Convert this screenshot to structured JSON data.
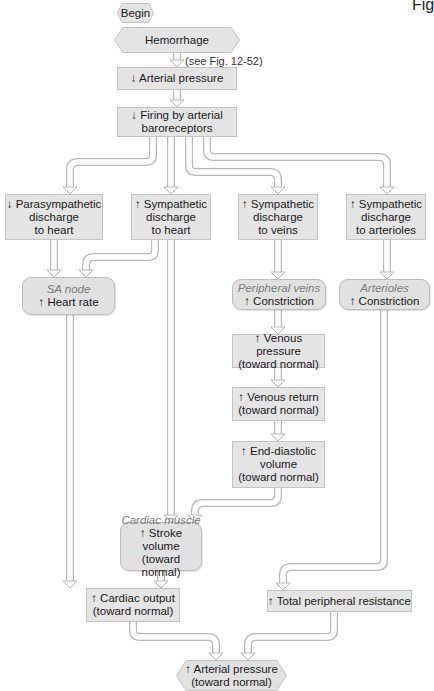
{
  "figure": {
    "corner_label": "Fig",
    "begin": "Begin",
    "start": "Hemorrhage",
    "reference_note": "(see Fig. 12-52)",
    "nodes": {
      "arterial_pressure_down": "↓ Arterial pressure",
      "baroreceptors": [
        "↓ Firing by arterial",
        "baroreceptors"
      ],
      "parasympathetic_heart": [
        "↓ Parasympathetic",
        "discharge",
        "to heart"
      ],
      "sympathetic_heart": [
        "↑ Sympathetic",
        "discharge",
        "to heart"
      ],
      "sympathetic_veins": [
        "↑ Sympathetic",
        "discharge",
        "to veins"
      ],
      "sympathetic_arterioles": [
        "↑ Sympathetic",
        "discharge",
        "to arterioles"
      ],
      "sa_node": {
        "site": "SA node",
        "effect": "↑ Heart rate"
      },
      "peripheral_veins": {
        "site": "Peripheral veins",
        "effect": "↑ Constriction"
      },
      "arterioles": {
        "site": "Arterioles",
        "effect": "↑ Constriction"
      },
      "venous_pressure": [
        "↑ Venous pressure",
        "(toward normal)"
      ],
      "venous_return": [
        "↑ Venous return",
        "(toward normal)"
      ],
      "end_diastolic": [
        "↑ End-diastolic",
        "volume",
        "(toward normal)"
      ],
      "cardiac_muscle": {
        "site": "Cardiac muscle",
        "effect": [
          "↑ Stroke volume",
          "(toward normal)"
        ]
      },
      "cardiac_output": [
        "↑ Cardiac output",
        "(toward normal)"
      ],
      "tpr": "↑ Total peripheral resistance",
      "arterial_pressure_up": [
        "↑ Arterial pressure",
        "(toward normal)"
      ]
    }
  },
  "colors": {
    "box_fill": "#e4e4e4",
    "box_border": "#c4c4c4",
    "pipe_outline": "#b8b8b8",
    "pipe_fill": "#ffffff",
    "site_label": "#7a7a7a"
  }
}
